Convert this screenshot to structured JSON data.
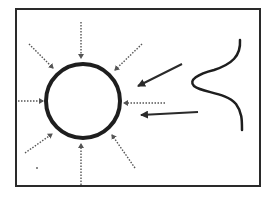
{
  "diagram": {
    "title": "",
    "colors": {
      "background": "#ffffff",
      "stroke": "#2a2a2a",
      "dotted": "#555555"
    },
    "frame": {
      "x": 16,
      "y": 9,
      "width": 244,
      "height": 177
    },
    "circle": {
      "cx": 83,
      "cy": 101,
      "r": 37
    },
    "dotted_arrows": [
      {
        "name": "top",
        "x1": 81,
        "y1": 22,
        "x2": 81,
        "y2": 58
      },
      {
        "name": "top-left",
        "x1": 29,
        "y1": 44,
        "x2": 53,
        "y2": 68
      },
      {
        "name": "top-right",
        "x1": 142,
        "y1": 44,
        "x2": 115,
        "y2": 70
      },
      {
        "name": "left",
        "x1": 18,
        "y1": 101,
        "x2": 43,
        "y2": 101
      },
      {
        "name": "right",
        "x1": 165,
        "y1": 103,
        "x2": 124,
        "y2": 103
      },
      {
        "name": "bottom-left",
        "x1": 25,
        "y1": 153,
        "x2": 52,
        "y2": 134
      },
      {
        "name": "bottom",
        "x1": 81,
        "y1": 185,
        "x2": 81,
        "y2": 144
      },
      {
        "name": "bottom-right",
        "x1": 135,
        "y1": 168,
        "x2": 112,
        "y2": 135
      }
    ],
    "solid_arrows": [
      {
        "name": "upper",
        "x1": 182,
        "y1": 64,
        "x2": 138,
        "y2": 86
      },
      {
        "name": "lower",
        "x1": 198,
        "y1": 112,
        "x2": 141,
        "y2": 115
      }
    ],
    "curve": {
      "path": "M 240 40 C 241 56, 232 64, 214 70 C 198 74, 188 80, 194 86 C 202 93, 226 92, 236 104 C 242 112, 242 120, 242 130"
    },
    "dot": {
      "cx": 37,
      "cy": 168,
      "r": 1
    }
  }
}
